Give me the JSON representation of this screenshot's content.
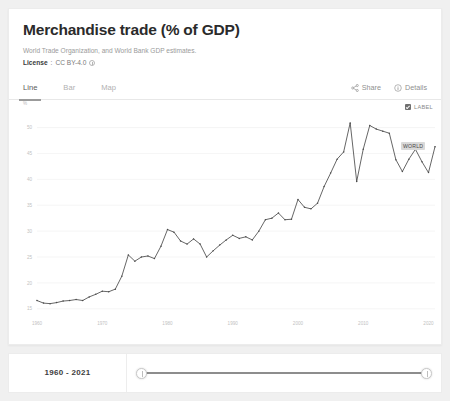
{
  "card": {
    "title": "Merchandise trade (% of GDP)",
    "source": "World Trade Organization, and World Bank GDP estimates.",
    "license_label": "License",
    "license_separator": ":",
    "license_value": "CC BY-4.0"
  },
  "tabs": [
    {
      "label": "Line",
      "active": true
    },
    {
      "label": "Bar",
      "active": false
    },
    {
      "label": "Map",
      "active": false
    }
  ],
  "toolbar": {
    "share_label": "Share",
    "details_label": "Details"
  },
  "legend": {
    "label_checkbox": "LABEL",
    "checked": true
  },
  "series_label": "WORLD",
  "slider": {
    "range_text": "1960 - 2021"
  },
  "colors": {
    "line": "#4a4a4a",
    "grid": "#f2f2f2",
    "axis_text": "#c2c2c2",
    "card_bg": "#ffffff",
    "page_bg": "#f0f0f0",
    "title": "#2b2b2b"
  },
  "chart_data": {
    "type": "line",
    "title": "Merchandise trade (% of GDP)",
    "xlabel": "",
    "ylabel": "%",
    "yunit": "%",
    "xlim": [
      1960,
      2021
    ],
    "ylim": [
      14,
      53
    ],
    "grid": true,
    "legend_position": "top-right",
    "yticks": [
      15,
      20,
      25,
      30,
      35,
      40,
      45,
      50
    ],
    "ytick_labels": [
      "15",
      "20",
      "25",
      "30",
      "35",
      "40",
      "45",
      "50"
    ],
    "xticks": [
      1960,
      1970,
      1980,
      1990,
      2000,
      2010,
      2020
    ],
    "xtick_labels": [
      "1960",
      "1970",
      "1980",
      "1990",
      "2000",
      "2010",
      "2020"
    ],
    "series": [
      {
        "name": "WORLD",
        "x": [
          1960,
          1961,
          1962,
          1963,
          1964,
          1965,
          1966,
          1967,
          1968,
          1969,
          1970,
          1971,
          1972,
          1973,
          1974,
          1975,
          1976,
          1977,
          1978,
          1979,
          1980,
          1981,
          1982,
          1983,
          1984,
          1985,
          1986,
          1987,
          1988,
          1989,
          1990,
          1991,
          1992,
          1993,
          1994,
          1995,
          1996,
          1997,
          1998,
          1999,
          2000,
          2001,
          2002,
          2003,
          2004,
          2005,
          2006,
          2007,
          2008,
          2009,
          2010,
          2011,
          2012,
          2013,
          2014,
          2015,
          2016,
          2017,
          2018,
          2019,
          2020,
          2021
        ],
        "values": [
          16.6,
          16.1,
          16.0,
          16.2,
          16.5,
          16.6,
          16.8,
          16.6,
          17.3,
          17.8,
          18.4,
          18.3,
          18.8,
          21.3,
          25.4,
          24.2,
          25.0,
          25.2,
          24.7,
          27.1,
          30.3,
          29.8,
          28.1,
          27.5,
          28.5,
          27.5,
          25.0,
          26.2,
          27.3,
          28.3,
          29.2,
          28.6,
          28.9,
          28.3,
          30.0,
          32.2,
          32.5,
          33.5,
          32.2,
          32.3,
          36.1,
          34.6,
          34.3,
          35.4,
          38.6,
          41.2,
          43.9,
          45.3,
          50.9,
          39.6,
          45.8,
          50.4,
          49.7,
          49.3,
          48.9,
          43.8,
          41.5,
          43.9,
          45.8,
          43.4,
          41.3,
          46.3
        ]
      }
    ]
  }
}
